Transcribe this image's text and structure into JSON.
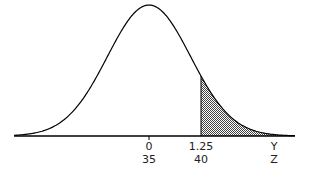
{
  "chart_data": {
    "type": "area",
    "title": "",
    "distribution": "normal",
    "mean": 0,
    "sd": 1,
    "shaded_region": {
      "from": 1.25,
      "to": "inf",
      "fill": "stippled gray"
    },
    "axis_rows": [
      {
        "name": "Y",
        "ticks": [
          {
            "pos": 0,
            "label": "0"
          },
          {
            "pos": 1.25,
            "label": "1.25"
          }
        ]
      },
      {
        "name": "Z",
        "ticks": [
          {
            "pos": 0,
            "label": "35"
          },
          {
            "pos": 1.25,
            "label": "40"
          }
        ]
      }
    ],
    "xlim": [
      -3.25,
      3.5
    ],
    "grid": false,
    "legend": null
  },
  "labels": {
    "row1": [
      "0",
      "1.25",
      "Y"
    ],
    "row2": [
      "35",
      "40",
      "Z"
    ]
  },
  "colors": {
    "line": "#000000",
    "shade": "#555555",
    "background": "#ffffff"
  }
}
